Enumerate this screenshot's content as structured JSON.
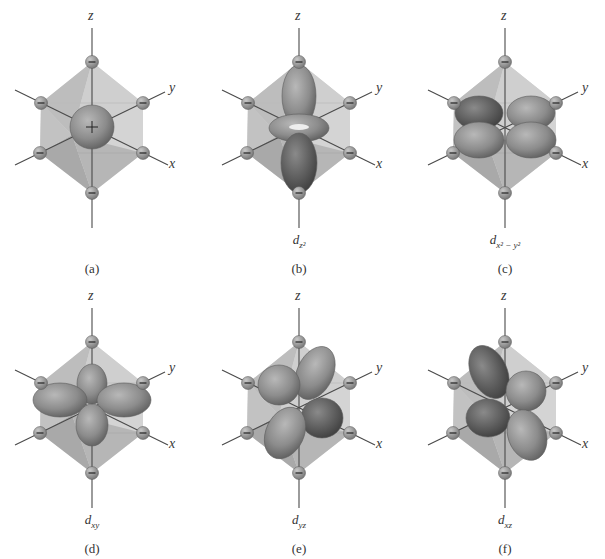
{
  "figure": {
    "panels": [
      {
        "id": "a",
        "label": "(a)",
        "orbital": "",
        "orbital_sub": "",
        "type": "s"
      },
      {
        "id": "b",
        "label": "(b)",
        "orbital": "d",
        "orbital_sub": "z²",
        "type": "dz2"
      },
      {
        "id": "c",
        "label": "(c)",
        "orbital": "d",
        "orbital_sub": "x² − y²",
        "type": "dx2y2"
      },
      {
        "id": "d",
        "label": "(d)",
        "orbital": "d",
        "orbital_sub": "xy",
        "type": "dxy"
      },
      {
        "id": "e",
        "label": "(e)",
        "orbital": "d",
        "orbital_sub": "yz",
        "type": "dyz"
      },
      {
        "id": "f",
        "label": "(f)",
        "orbital": "d",
        "orbital_sub": "xz",
        "type": "dxz"
      }
    ],
    "axes": {
      "x": "x",
      "y": "y",
      "z": "z"
    },
    "ligand_charge_symbol": "−",
    "center_charge_symbol": "+",
    "colors": {
      "octahedron_light": "#d4d4d4",
      "octahedron_dark": "#a9a9a9",
      "orbital_fill": "#8c8c8c",
      "orbital_dark": "#5e5e5e",
      "axis_line": "#4a4a4a",
      "ligand": "#7a7a7a"
    }
  }
}
